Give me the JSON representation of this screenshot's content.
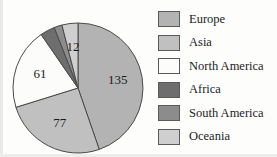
{
  "chart_data": {
    "type": "pie",
    "title": "",
    "subtitle": "",
    "xlabel": "",
    "ylabel": "",
    "total": 302,
    "legend_position": "right",
    "grid": false,
    "value_labels_shown": true,
    "categories": [
      "Europe",
      "Asia",
      "North America",
      "Africa",
      "South America",
      "Oceania"
    ],
    "values": [
      135,
      77,
      61,
      11,
      6,
      12
    ],
    "colors": [
      "#b3b3b3",
      "#c0c0c0",
      "#fcfcfa",
      "#6e6e6e",
      "#8c8c8c",
      "#cfcfcf"
    ],
    "slices": [
      {
        "label": "Europe",
        "value": 135,
        "color": "#b3b3b3",
        "label_text": "135",
        "label_placement": "inside"
      },
      {
        "label": "Asia",
        "value": 77,
        "color": "#c0c0c0",
        "label_text": "77",
        "label_placement": "inside"
      },
      {
        "label": "North America",
        "value": 61,
        "color": "#fcfcfa",
        "label_text": "61",
        "label_placement": "inside"
      },
      {
        "label": "Africa",
        "value": 11,
        "color": "#6e6e6e",
        "label_text": "11",
        "label_placement": "outside"
      },
      {
        "label": "South America",
        "value": 6,
        "color": "#8c8c8c",
        "label_text": "6",
        "label_placement": "outside"
      },
      {
        "label": "Oceania",
        "value": 12,
        "color": "#cfcfcf",
        "label_text": "12",
        "label_placement": "inside"
      }
    ]
  },
  "legend": {
    "items": [
      {
        "label": "Europe",
        "color": "#b3b3b3"
      },
      {
        "label": "Asia",
        "color": "#c0c0c0"
      },
      {
        "label": "North America",
        "color": "#fcfcfa"
      },
      {
        "label": "Africa",
        "color": "#6e6e6e"
      },
      {
        "label": "South America",
        "color": "#8c8c8c"
      },
      {
        "label": "Oceania",
        "color": "#cfcfcf"
      }
    ]
  },
  "style": {
    "outline_color": "#4a4a4a",
    "text_color": "#1c1c1c",
    "background": "#fdfdfc"
  }
}
